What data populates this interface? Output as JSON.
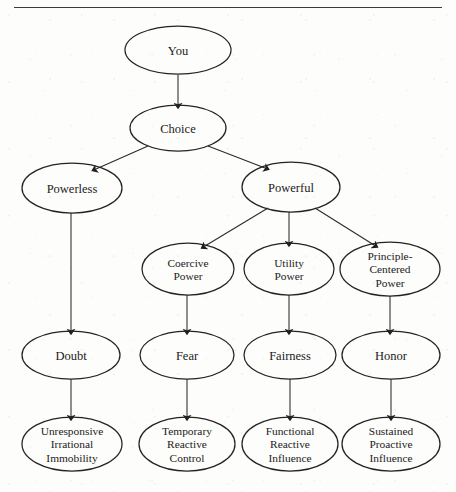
{
  "page": {
    "running_head": "The Power Process",
    "width": 456,
    "height": 492,
    "background_color": "#fdfdfc",
    "ink_color": "#1b1b1b"
  },
  "chart_data": {
    "type": "diagram",
    "title": "The Power Process",
    "layout": "top-down hierarchy tree of ellipse nodes joined by single-headed arrows",
    "node_shape": "ellipse",
    "edge_style": "straight line with solid triangular arrowhead",
    "levels": [
      {
        "level": 1,
        "nodes": [
          "You"
        ]
      },
      {
        "level": 2,
        "nodes": [
          "Choice"
        ]
      },
      {
        "level": 3,
        "nodes": [
          "Powerless",
          "Powerful"
        ]
      },
      {
        "level": 4,
        "nodes": [
          "Coercive Power",
          "Utility Power",
          "Principle-Centered Power"
        ]
      },
      {
        "level": 5,
        "nodes": [
          "Doubt",
          "Fear",
          "Fairness",
          "Honor"
        ]
      },
      {
        "level": 6,
        "nodes": [
          "Unresponsive Irrational Immobility",
          "Temporary Reactive Control",
          "Functional Reactive Influence",
          "Sustained Proactive Influence"
        ]
      }
    ],
    "nodes": [
      {
        "id": "you",
        "lines": [
          "You"
        ],
        "cx": 178,
        "cy": 50,
        "rx": 53,
        "ry": 24
      },
      {
        "id": "choice",
        "lines": [
          "Choice"
        ],
        "cx": 178,
        "cy": 128,
        "rx": 48,
        "ry": 23
      },
      {
        "id": "powerless",
        "lines": [
          "Powerless"
        ],
        "cx": 72,
        "cy": 188,
        "rx": 50,
        "ry": 25
      },
      {
        "id": "powerful",
        "lines": [
          "Powerful"
        ],
        "cx": 291,
        "cy": 187,
        "rx": 49,
        "ry": 25
      },
      {
        "id": "coercive",
        "lines": [
          "Coercive",
          "Power"
        ],
        "cx": 188,
        "cy": 269,
        "rx": 46,
        "ry": 26
      },
      {
        "id": "utility",
        "lines": [
          "Utility",
          "Power"
        ],
        "cx": 289,
        "cy": 269,
        "rx": 45,
        "ry": 26
      },
      {
        "id": "principle",
        "lines": [
          "Principle-",
          "Centered",
          "Power"
        ],
        "cx": 390,
        "cy": 269,
        "rx": 50,
        "ry": 27
      },
      {
        "id": "doubt",
        "lines": [
          "Doubt"
        ],
        "cx": 71,
        "cy": 355,
        "rx": 49,
        "ry": 24
      },
      {
        "id": "fear",
        "lines": [
          "Fear"
        ],
        "cx": 187,
        "cy": 355,
        "rx": 47,
        "ry": 24
      },
      {
        "id": "fairness",
        "lines": [
          "Fairness"
        ],
        "cx": 290,
        "cy": 355,
        "rx": 46,
        "ry": 24
      },
      {
        "id": "honor",
        "lines": [
          "Honor"
        ],
        "cx": 391,
        "cy": 355,
        "rx": 49,
        "ry": 24
      },
      {
        "id": "immobility",
        "lines": [
          "Unresponsive",
          "Irrational",
          "Immobility"
        ],
        "cx": 72,
        "cy": 444,
        "rx": 50,
        "ry": 27
      },
      {
        "id": "control",
        "lines": [
          "Temporary",
          "Reactive",
          "Control"
        ],
        "cx": 187,
        "cy": 444,
        "rx": 48,
        "ry": 27
      },
      {
        "id": "functional",
        "lines": [
          "Functional",
          "Reactive",
          "Influence"
        ],
        "cx": 290,
        "cy": 444,
        "rx": 48,
        "ry": 27
      },
      {
        "id": "sustained",
        "lines": [
          "Sustained",
          "Proactive",
          "Influence"
        ],
        "cx": 391,
        "cy": 444,
        "rx": 49,
        "ry": 27
      }
    ],
    "edges": [
      {
        "from": "you",
        "to": "choice",
        "x1": 178,
        "y1": 75,
        "x2": 178,
        "y2": 104
      },
      {
        "from": "choice",
        "to": "powerless",
        "x1": 148,
        "y1": 146,
        "x2": 96,
        "y2": 169
      },
      {
        "from": "choice",
        "to": "powerful",
        "x1": 208,
        "y1": 146,
        "x2": 265,
        "y2": 168
      },
      {
        "from": "powerful",
        "to": "coercive",
        "x1": 268,
        "y1": 208,
        "x2": 205,
        "y2": 246
      },
      {
        "from": "powerful",
        "to": "utility",
        "x1": 289,
        "y1": 212,
        "x2": 289,
        "y2": 242
      },
      {
        "from": "powerful",
        "to": "principle",
        "x1": 315,
        "y1": 208,
        "x2": 374,
        "y2": 245
      },
      {
        "from": "powerless",
        "to": "doubt",
        "x1": 71,
        "y1": 213,
        "x2": 71,
        "y2": 330
      },
      {
        "from": "coercive",
        "to": "fear",
        "x1": 187,
        "y1": 295,
        "x2": 187,
        "y2": 330
      },
      {
        "from": "utility",
        "to": "fairness",
        "x1": 289,
        "y1": 295,
        "x2": 289,
        "y2": 330
      },
      {
        "from": "principle",
        "to": "honor",
        "x1": 390,
        "y1": 296,
        "x2": 390,
        "y2": 330
      },
      {
        "from": "doubt",
        "to": "immobility",
        "x1": 71,
        "y1": 379,
        "x2": 71,
        "y2": 416
      },
      {
        "from": "fear",
        "to": "control",
        "x1": 187,
        "y1": 379,
        "x2": 187,
        "y2": 416
      },
      {
        "from": "fairness",
        "to": "functional",
        "x1": 290,
        "y1": 379,
        "x2": 290,
        "y2": 416
      },
      {
        "from": "honor",
        "to": "sustained",
        "x1": 391,
        "y1": 379,
        "x2": 391,
        "y2": 416
      }
    ]
  }
}
